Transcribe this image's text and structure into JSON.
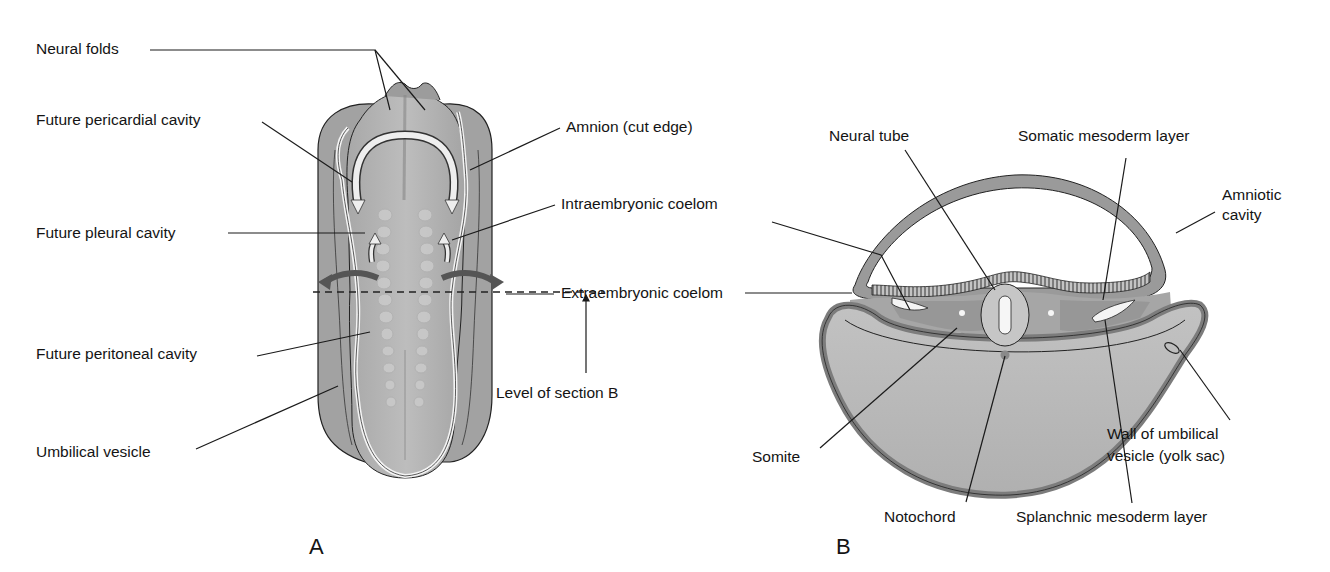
{
  "figure": {
    "panel_a": {
      "letter": "A",
      "labels": {
        "neural_folds": "Neural folds",
        "future_pericardial_cavity": "Future pericardial cavity",
        "future_pleural_cavity": "Future pleural cavity",
        "future_peritoneal_cavity": "Future peritoneal cavity",
        "umbilical_vesicle": "Umbilical vesicle",
        "amnion_cut_edge": "Amnion (cut edge)",
        "intraembryonic_coelom": "Intraembryonic coelom",
        "extraembryonic_coelom": "Extraembryonic coelom",
        "level_of_section_b": "Level of section B"
      }
    },
    "panel_b": {
      "letter": "B",
      "labels": {
        "neural_tube": "Neural tube",
        "somatic_mesoderm_layer": "Somatic mesoderm layer",
        "amniotic_cavity_line1": "Amniotic",
        "amniotic_cavity_line2": "cavity",
        "somite": "Somite",
        "notochord": "Notochord",
        "splanchnic_mesoderm_layer": "Splanchnic mesoderm layer",
        "wall_umbilical_line1": "Wall of umbilical",
        "wall_umbilical_line2": "vesicle (yolk sac)"
      }
    },
    "colors": {
      "outer_tissue": "#9a9a9a",
      "mid_tissue": "#b4b4b4",
      "light_tissue": "#c8c8c8",
      "dark_band": "#7c7c7c",
      "highlight": "#f2f2f2",
      "line": "#1a1a1a"
    }
  }
}
